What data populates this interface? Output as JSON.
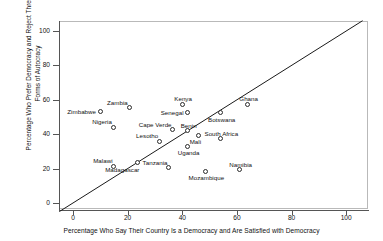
{
  "chart_data": {
    "type": "scatter",
    "title": "",
    "xlabel": "Percentage Who Say Their Country Is a Democracy and Are Satisfied with Democracy",
    "ylabel": "Percentage Who Prefer Democracy and Reject Three Forms of Autocracy",
    "xlim": [
      -5,
      106
    ],
    "ylim": [
      -6,
      107
    ],
    "xticks": [
      0,
      20,
      40,
      60,
      80,
      100
    ],
    "yticks": [
      0,
      20,
      40,
      60,
      80,
      100
    ],
    "xtick_labels": [
      "0",
      "20",
      "40",
      "60",
      "80",
      "100"
    ],
    "ytick_labels": [
      "0",
      "20",
      "40",
      "60",
      "80",
      "100"
    ],
    "grid": false,
    "legend": "none",
    "reference_line": {
      "name": "45-degree-line",
      "from": [
        -5,
        -5
      ],
      "to": [
        106,
        106
      ],
      "color": "#1a1a1a"
    },
    "marker": {
      "shape": "open-circle",
      "edge_color": "#2b2b2b",
      "face_color": "#ffffff",
      "size": 5
    },
    "points": [
      {
        "label": "Zimbabwe",
        "x": 10.0,
        "y": 53.0,
        "label_pos": "left"
      },
      {
        "label": "Zambia",
        "x": 20.5,
        "y": 55.5,
        "label_pos": "up-left"
      },
      {
        "label": "Nigeria",
        "x": 14.7,
        "y": 44.0,
        "label_pos": "up-left"
      },
      {
        "label": "Cape Verde",
        "x": 36.5,
        "y": 42.5,
        "label_pos": "up-left"
      },
      {
        "label": "Lesotho",
        "x": 31.5,
        "y": 36.0,
        "label_pos": "up-left"
      },
      {
        "label": "Malawi",
        "x": 14.7,
        "y": 21.5,
        "label_pos": "up-left"
      },
      {
        "label": "Madagascar",
        "x": 23.5,
        "y": 23.5,
        "label_pos": "down-left"
      },
      {
        "label": "Tanzania",
        "x": 35.0,
        "y": 20.5,
        "label_pos": "up-left"
      },
      {
        "label": "Kenya",
        "x": 40.0,
        "y": 57.5,
        "label_pos": "up-right"
      },
      {
        "label": "Senegal",
        "x": 42.0,
        "y": 52.5,
        "label_pos": "left"
      },
      {
        "label": "Benin",
        "x": 42.0,
        "y": 42.0,
        "label_pos": "up-right"
      },
      {
        "label": "Mali",
        "x": 46.0,
        "y": 39.5,
        "label_pos": "down-left"
      },
      {
        "label": "Uganda",
        "x": 42.0,
        "y": 33.0,
        "label_pos": "down-right"
      },
      {
        "label": "Mozambique",
        "x": 48.5,
        "y": 18.5,
        "label_pos": "down-right"
      },
      {
        "label": "Botswana",
        "x": 54.0,
        "y": 52.5,
        "label_pos": "down-right"
      },
      {
        "label": "South Africa",
        "x": 54.0,
        "y": 37.5,
        "label_pos": "up-right"
      },
      {
        "label": "Namibia",
        "x": 61.0,
        "y": 19.5,
        "label_pos": "up-right"
      },
      {
        "label": "Ghana",
        "x": 64.0,
        "y": 57.5,
        "label_pos": "up-right"
      }
    ]
  },
  "axes": {
    "x_title": "Percentage Who Say Their Country Is a Democracy and Are Satisfied with Democracy",
    "y_title": "Percentage Who Prefer Democracy and Reject Three Forms of Autocracy"
  },
  "colors": {
    "background": "#ffffff",
    "axis": "#555555",
    "frame": "#b9b9b9",
    "text": "#111111",
    "marker_edge": "#2b2b2b",
    "line": "#1a1a1a"
  }
}
